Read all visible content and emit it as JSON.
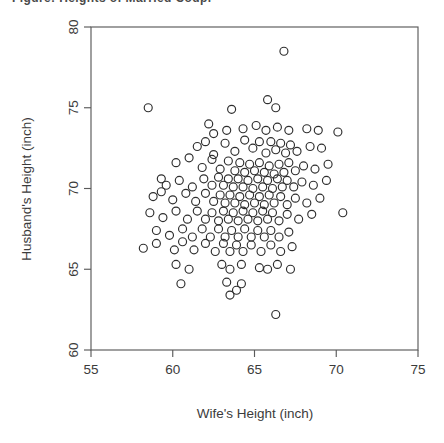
{
  "caption_fragment": "Figure: Heights of Married Couples",
  "colors": {
    "background": "#ffffff",
    "axis": "#5a5a5a",
    "text": "#3b3b3b",
    "marker": "#2e2e2e"
  },
  "chart_data": {
    "type": "scatter",
    "title": "",
    "xlabel": "Wife's Height (inch)",
    "ylabel": "Husband's Height (inch)",
    "xlim": [
      55,
      75
    ],
    "ylim": [
      60,
      80
    ],
    "xticks": [
      55,
      60,
      65,
      70,
      75
    ],
    "yticks": [
      60,
      65,
      70,
      75,
      80
    ],
    "xtick_labels": [
      "55",
      "60",
      "65",
      "70",
      "75"
    ],
    "ytick_labels": [
      "60",
      "65",
      "70",
      "75",
      "80"
    ],
    "grid": false,
    "legend": null,
    "marker": "open-circle",
    "marker_size": 8,
    "n_points": 170,
    "points": [
      [
        66.8,
        78.5
      ],
      [
        58.5,
        75.0
      ],
      [
        63.6,
        74.9
      ],
      [
        65.8,
        75.5
      ],
      [
        66.3,
        75.0
      ],
      [
        62.2,
        74.0
      ],
      [
        62.5,
        73.4
      ],
      [
        63.3,
        73.6
      ],
      [
        64.3,
        73.7
      ],
      [
        65.1,
        73.9
      ],
      [
        65.7,
        73.6
      ],
      [
        66.4,
        73.8
      ],
      [
        67.1,
        73.6
      ],
      [
        68.2,
        73.7
      ],
      [
        68.9,
        73.6
      ],
      [
        70.1,
        73.5
      ],
      [
        61.5,
        72.6
      ],
      [
        62.0,
        72.9
      ],
      [
        62.5,
        72.1
      ],
      [
        63.2,
        72.8
      ],
      [
        63.8,
        72.3
      ],
      [
        64.4,
        73.0
      ],
      [
        64.9,
        72.5
      ],
      [
        65.3,
        72.9
      ],
      [
        65.7,
        72.2
      ],
      [
        66.0,
        72.9
      ],
      [
        66.3,
        72.4
      ],
      [
        66.6,
        72.8
      ],
      [
        66.9,
        72.2
      ],
      [
        67.2,
        72.7
      ],
      [
        67.6,
        72.3
      ],
      [
        68.4,
        72.6
      ],
      [
        69.1,
        72.5
      ],
      [
        60.2,
        71.6
      ],
      [
        61.0,
        71.9
      ],
      [
        61.8,
        71.3
      ],
      [
        62.4,
        71.8
      ],
      [
        62.9,
        71.2
      ],
      [
        63.4,
        71.7
      ],
      [
        63.8,
        71.1
      ],
      [
        64.1,
        71.6
      ],
      [
        64.4,
        71.0
      ],
      [
        64.7,
        71.5
      ],
      [
        65.0,
        71.1
      ],
      [
        65.3,
        71.6
      ],
      [
        65.6,
        71.0
      ],
      [
        65.9,
        71.4
      ],
      [
        66.2,
        70.9
      ],
      [
        66.5,
        71.5
      ],
      [
        66.8,
        71.0
      ],
      [
        67.1,
        71.6
      ],
      [
        67.5,
        71.1
      ],
      [
        68.0,
        71.4
      ],
      [
        68.7,
        71.2
      ],
      [
        69.5,
        71.5
      ],
      [
        59.3,
        70.6
      ],
      [
        59.6,
        70.2
      ],
      [
        60.4,
        70.5
      ],
      [
        61.2,
        70.1
      ],
      [
        61.9,
        70.6
      ],
      [
        62.4,
        70.2
      ],
      [
        62.8,
        70.7
      ],
      [
        63.1,
        70.2
      ],
      [
        63.4,
        70.6
      ],
      [
        63.7,
        70.1
      ],
      [
        64.0,
        70.6
      ],
      [
        64.3,
        70.1
      ],
      [
        64.6,
        70.5
      ],
      [
        64.9,
        70.0
      ],
      [
        65.2,
        70.6
      ],
      [
        65.5,
        70.1
      ],
      [
        65.8,
        70.5
      ],
      [
        66.1,
        70.0
      ],
      [
        66.4,
        70.6
      ],
      [
        66.7,
        70.1
      ],
      [
        67.0,
        70.5
      ],
      [
        67.4,
        70.1
      ],
      [
        67.9,
        70.4
      ],
      [
        68.6,
        70.2
      ],
      [
        69.4,
        70.5
      ],
      [
        58.8,
        69.5
      ],
      [
        59.3,
        69.8
      ],
      [
        60.0,
        69.3
      ],
      [
        60.8,
        69.7
      ],
      [
        61.4,
        69.2
      ],
      [
        62.0,
        69.7
      ],
      [
        62.5,
        69.2
      ],
      [
        62.9,
        69.6
      ],
      [
        63.2,
        69.1
      ],
      [
        63.5,
        69.6
      ],
      [
        63.8,
        69.1
      ],
      [
        64.1,
        69.5
      ],
      [
        64.4,
        69.0
      ],
      [
        64.7,
        69.6
      ],
      [
        65.0,
        69.1
      ],
      [
        65.3,
        69.5
      ],
      [
        65.6,
        69.0
      ],
      [
        65.9,
        69.6
      ],
      [
        66.2,
        69.1
      ],
      [
        66.6,
        69.5
      ],
      [
        67.0,
        69.0
      ],
      [
        67.5,
        69.4
      ],
      [
        68.2,
        69.1
      ],
      [
        69.0,
        69.4
      ],
      [
        70.4,
        68.5
      ],
      [
        58.6,
        68.5
      ],
      [
        59.4,
        68.2
      ],
      [
        60.2,
        68.6
      ],
      [
        60.9,
        68.1
      ],
      [
        61.5,
        68.6
      ],
      [
        62.0,
        68.1
      ],
      [
        62.4,
        68.5
      ],
      [
        62.8,
        68.0
      ],
      [
        63.1,
        68.6
      ],
      [
        63.4,
        68.1
      ],
      [
        63.7,
        68.5
      ],
      [
        64.0,
        68.0
      ],
      [
        64.3,
        68.6
      ],
      [
        64.6,
        68.1
      ],
      [
        64.9,
        68.5
      ],
      [
        65.2,
        68.0
      ],
      [
        65.5,
        68.6
      ],
      [
        65.8,
        68.1
      ],
      [
        66.1,
        68.5
      ],
      [
        66.5,
        68.0
      ],
      [
        67.0,
        68.4
      ],
      [
        67.7,
        68.1
      ],
      [
        68.5,
        68.4
      ],
      [
        59.0,
        67.4
      ],
      [
        59.8,
        67.1
      ],
      [
        60.6,
        67.5
      ],
      [
        61.2,
        67.0
      ],
      [
        61.8,
        67.5
      ],
      [
        62.3,
        67.0
      ],
      [
        62.8,
        67.5
      ],
      [
        63.2,
        67.0
      ],
      [
        63.6,
        67.4
      ],
      [
        64.0,
        67.0
      ],
      [
        64.4,
        67.5
      ],
      [
        64.8,
        67.0
      ],
      [
        65.2,
        67.4
      ],
      [
        65.6,
        67.0
      ],
      [
        66.0,
        67.4
      ],
      [
        66.5,
        67.0
      ],
      [
        67.1,
        67.3
      ],
      [
        58.2,
        66.3
      ],
      [
        59.0,
        66.6
      ],
      [
        60.1,
        66.2
      ],
      [
        60.6,
        66.7
      ],
      [
        61.3,
        66.2
      ],
      [
        62.0,
        66.6
      ],
      [
        62.6,
        66.1
      ],
      [
        63.1,
        66.6
      ],
      [
        63.5,
        66.1
      ],
      [
        63.9,
        66.5
      ],
      [
        64.3,
        66.1
      ],
      [
        64.8,
        66.5
      ],
      [
        65.4,
        66.1
      ],
      [
        66.0,
        66.5
      ],
      [
        66.6,
        66.1
      ],
      [
        67.3,
        66.4
      ],
      [
        60.2,
        65.3
      ],
      [
        61.0,
        65.0
      ],
      [
        63.0,
        65.3
      ],
      [
        63.5,
        65.0
      ],
      [
        64.2,
        65.3
      ],
      [
        65.3,
        65.1
      ],
      [
        65.8,
        65.0
      ],
      [
        66.4,
        65.3
      ],
      [
        67.2,
        65.0
      ],
      [
        60.5,
        64.1
      ],
      [
        63.3,
        64.2
      ],
      [
        64.2,
        64.1
      ],
      [
        63.5,
        63.4
      ],
      [
        63.9,
        63.7
      ],
      [
        66.3,
        62.2
      ]
    ]
  }
}
